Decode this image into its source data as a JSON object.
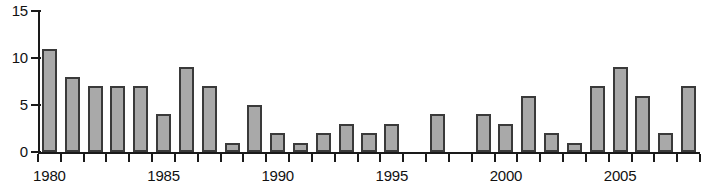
{
  "chart_data": {
    "type": "bar",
    "title": "",
    "subtitle": "",
    "xlabel": "",
    "ylabel": "",
    "categories": [
      "1980",
      "1981",
      "1982",
      "1983",
      "1984",
      "1985",
      "1986",
      "1987",
      "1988",
      "1989",
      "1990",
      "1991",
      "1992",
      "1993",
      "1994",
      "1995",
      "1996",
      "1997",
      "1998",
      "1999",
      "2000",
      "2001",
      "2002",
      "2003",
      "2004",
      "2005",
      "2006",
      "2007",
      "2008"
    ],
    "values": [
      11,
      8,
      7,
      7,
      7,
      4,
      9,
      7,
      1,
      5,
      2,
      1,
      2,
      3,
      2,
      3,
      0,
      4,
      0,
      4,
      3,
      6,
      2,
      1,
      7,
      9,
      6,
      2,
      7
    ],
    "xlim": [
      1979.5,
      2008.5
    ],
    "ylim": [
      0,
      15
    ],
    "ytick_values": [
      0,
      5,
      10,
      15
    ],
    "ytick_labels": [
      "0",
      "5",
      "10",
      "15"
    ],
    "xtick_labels": [
      "1980",
      "1985",
      "1990",
      "1995",
      "2000",
      "2005"
    ],
    "xtick_label_years": [
      1980,
      1985,
      1990,
      1995,
      2000,
      2005
    ],
    "grid": false,
    "legend": null,
    "legend_position": "none",
    "annotations": [],
    "bar_fill_color": "#a9a9a9",
    "bar_edge_color": "#3a3a3a",
    "axis_color": "#1a1a1a",
    "background_color": "#ffffff"
  }
}
